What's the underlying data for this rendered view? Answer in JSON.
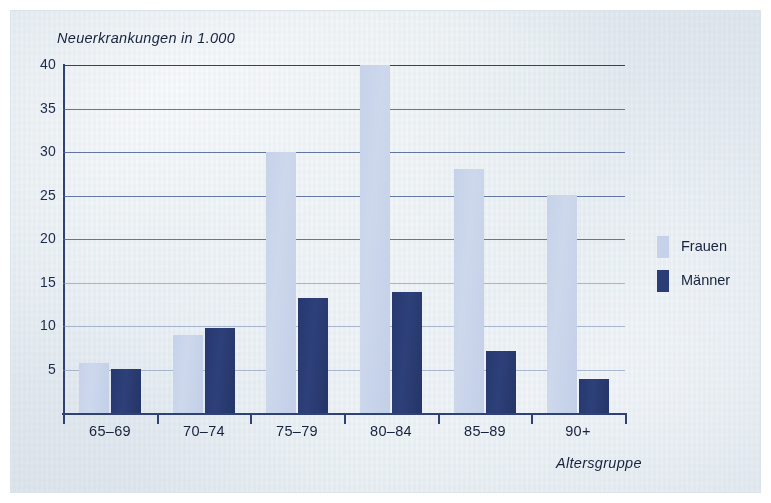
{
  "chart_data": {
    "type": "bar",
    "title": "Neuerkrankungen in 1.000",
    "xlabel": "Altersgruppe",
    "ylabel": "Neuerkrankungen in 1.000",
    "categories": [
      "65–69",
      "70–74",
      "75–79",
      "80–84",
      "85–89",
      "90+"
    ],
    "series": [
      {
        "name": "Frauen",
        "color": "#c5d2e9",
        "values": [
          5.8,
          9.0,
          30.0,
          40.0,
          28.0,
          25.0
        ]
      },
      {
        "name": "Männer",
        "color": "#2a3d74",
        "values": [
          5.0,
          9.8,
          13.2,
          13.9,
          7.1,
          3.9
        ]
      }
    ],
    "ylim": [
      0,
      40
    ],
    "yticks": [
      5,
      10,
      15,
      20,
      25,
      30,
      35,
      40
    ],
    "ytick_labels": [
      "5",
      "10",
      "15",
      "20",
      "25",
      "30",
      "35",
      "40"
    ],
    "grid": true,
    "legend_position": "right"
  },
  "legend": {
    "items": [
      {
        "label": "Frauen",
        "color": "#c5d2e9"
      },
      {
        "label": "Männer",
        "color": "#2a3d74"
      }
    ]
  },
  "colors": {
    "frauen": "#c5d2e9",
    "maenner": "#2a3d74",
    "axis": "#2f4272",
    "grid": "#4a5f93",
    "paper": "#e8eef2",
    "text": "#17223d"
  }
}
